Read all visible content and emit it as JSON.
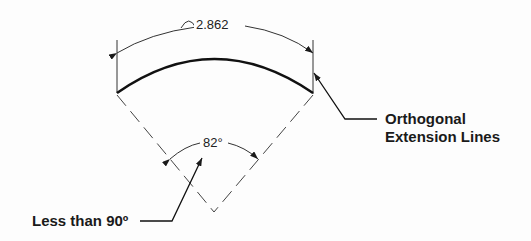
{
  "diagram": {
    "arc_length_dimension": "2.862",
    "angle_dimension": "82°",
    "labels": {
      "orthogonal_line1": "Orthogonal",
      "orthogonal_line2": "Extension Lines",
      "angle_note": "Less than 90º"
    },
    "colors": {
      "line": "#1a1a1a",
      "background": "#fdfdfd"
    }
  }
}
